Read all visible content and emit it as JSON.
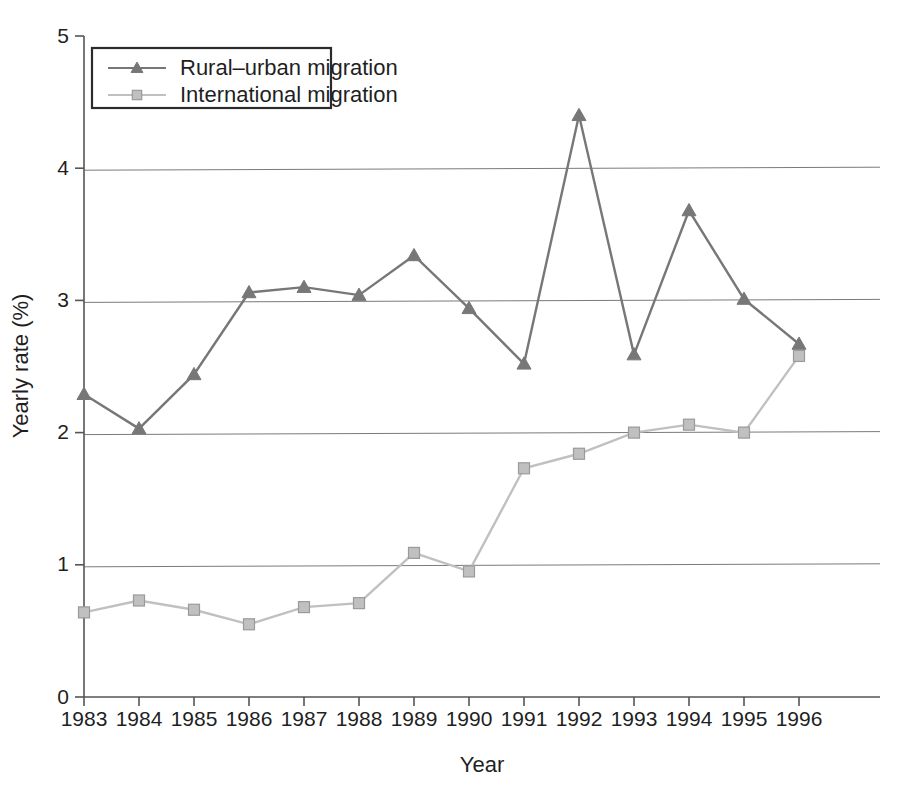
{
  "chart_data": {
    "type": "line",
    "title": "",
    "xlabel": "Year",
    "ylabel": "Yearly rate (%)",
    "categories": [
      "1983",
      "1984",
      "1985",
      "1986",
      "1987",
      "1988",
      "1989",
      "1990",
      "1991",
      "1992",
      "1993",
      "1994",
      "1995",
      "1996"
    ],
    "x": [
      1983,
      1984,
      1985,
      1986,
      1987,
      1988,
      1989,
      1990,
      1991,
      1992,
      1993,
      1994,
      1995,
      1996
    ],
    "ylim": [
      0,
      5
    ],
    "yticks": [
      "0",
      "1",
      "2",
      "3",
      "4",
      "5"
    ],
    "ytick_values": [
      0,
      1,
      2,
      3,
      4,
      5
    ],
    "grid": "horizontal",
    "legend_position": "top-left",
    "series": [
      {
        "name": "Rural–urban migration",
        "marker": "triangle",
        "color": "#777777",
        "values": [
          2.29,
          2.03,
          2.44,
          3.06,
          3.1,
          3.04,
          3.34,
          2.94,
          2.52,
          4.4,
          2.59,
          3.68,
          3.01,
          2.67
        ]
      },
      {
        "name": "International migration",
        "marker": "square",
        "color": "#c0c0c0",
        "values": [
          0.64,
          0.73,
          0.66,
          0.55,
          0.68,
          0.71,
          1.09,
          0.95,
          1.73,
          1.84,
          2.0,
          2.06,
          2.0,
          2.58
        ]
      }
    ]
  },
  "legend": {
    "entries": [
      {
        "label": "Rural–urban migration"
      },
      {
        "label": "International migration"
      }
    ]
  },
  "axes": {
    "x_title": "Year",
    "y_title": "Yearly rate (%)"
  }
}
